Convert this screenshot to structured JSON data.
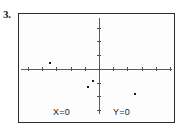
{
  "problem": {
    "number": "3."
  },
  "screen": {
    "labels": {
      "x_readout": "X=0",
      "y_readout": "Y=0"
    },
    "border_color": "#2b2b2b",
    "background_color": "#fdfdfd",
    "axis_color": "#555c5c",
    "point_color": "#171717"
  },
  "chart_data": {
    "type": "scatter",
    "title": "",
    "xlabel": "",
    "ylabel": "",
    "grid": false,
    "legend": null,
    "axis_origin_px": {
      "x": 80,
      "y": 55
    },
    "x_tick_spacing_px": 14.2,
    "y_tick_spacing_px": 13.7,
    "x_ticks_px": [
      9,
      23,
      37,
      52,
      66,
      80,
      94,
      108,
      123,
      137,
      151
    ],
    "y_ticks_px": [
      14,
      27,
      41,
      55,
      69,
      82,
      96
    ],
    "points_px": [
      {
        "x": 30,
        "y": 48
      },
      {
        "x": 73,
        "y": 66
      },
      {
        "x": 68,
        "y": 72
      },
      {
        "x": 115,
        "y": 79
      }
    ],
    "points": [
      {
        "x": -3.5,
        "y": 0.5
      },
      {
        "x": -0.5,
        "y": -0.8
      },
      {
        "x": -0.85,
        "y": -1.25
      },
      {
        "x": 2.45,
        "y": -1.75
      }
    ],
    "xlim": [
      -5.5,
      5.5
    ],
    "ylim": [
      -3.5,
      3.5
    ],
    "readouts": {
      "x": "X=0",
      "y": "Y=0"
    }
  }
}
